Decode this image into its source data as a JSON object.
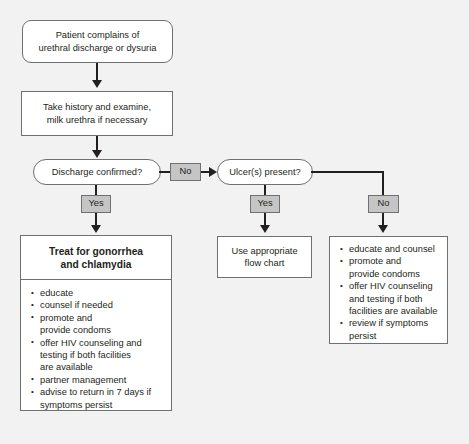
{
  "figure": {
    "background_color": "#f2f2f2",
    "node_fill": "#ffffff",
    "node_border": "#6f7072",
    "label_fill": "#c5c5c5",
    "line_color": "#231f20"
  },
  "nodes": {
    "start": {
      "shape": "rounded",
      "lines": [
        "Patient complains of",
        "urethral discharge or dysuria"
      ]
    },
    "history": {
      "shape": "rectangle",
      "lines": [
        "Take history and examine,",
        "milk urethra if necessary"
      ]
    },
    "discharge_decision": {
      "shape": "pill",
      "lines": [
        "Discharge confirmed?"
      ]
    },
    "ulcer_decision": {
      "shape": "pill",
      "lines": [
        "Ulcer(s) present?"
      ]
    },
    "flow_chart_box": {
      "shape": "rectangle",
      "lines": [
        "Use appropriate",
        "flow chart"
      ]
    }
  },
  "labels": {
    "discharge_yes": "Yes",
    "discharge_no": "No",
    "ulcer_yes": "Yes",
    "ulcer_no": "No"
  },
  "treatment": {
    "heading": [
      "Treat for gonorrhea",
      "and chlamydia"
    ],
    "bullets": [
      [
        "educate"
      ],
      [
        "counsel if needed"
      ],
      [
        "promote and",
        "provide condoms"
      ],
      [
        "offer HIV counseling and",
        "testing if both facilities",
        "are available"
      ],
      [
        "partner management"
      ],
      [
        "advise to return in 7 days if",
        "symptoms persist"
      ]
    ]
  },
  "counseling": {
    "bullets": [
      [
        "educate and counsel"
      ],
      [
        "promote and",
        "provide condoms"
      ],
      [
        "offer HIV counseling",
        "and testing if both",
        "facilities are available"
      ],
      [
        "review if symptoms",
        "persist"
      ]
    ]
  }
}
